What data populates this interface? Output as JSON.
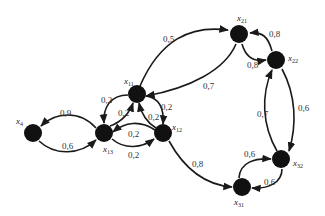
{
  "diagram": {
    "type": "directed-graph",
    "node_color": "#111111",
    "edge_color": "#1a1a1a",
    "background": "#ffffff",
    "nodes": [
      {
        "id": "x4",
        "label": "x",
        "sub": "4",
        "cx": 33,
        "cy": 133,
        "lx": 16,
        "ly": 124
      },
      {
        "id": "x13",
        "label": "x",
        "sub": "13",
        "cx": 104,
        "cy": 133,
        "lx": 103,
        "ly": 152
      },
      {
        "id": "x11",
        "label": "x",
        "sub": "11",
        "cx": 137,
        "cy": 94,
        "lx": 124,
        "ly": 84
      },
      {
        "id": "x12",
        "label": "x",
        "sub": "12",
        "cx": 163,
        "cy": 133,
        "lx": 172,
        "ly": 130
      },
      {
        "id": "x21",
        "label": "x",
        "sub": "21",
        "cx": 239,
        "cy": 34,
        "lx": 237,
        "ly": 21
      },
      {
        "id": "x22",
        "label": "x",
        "sub": "22",
        "cx": 276,
        "cy": 60,
        "lx": 288,
        "ly": 61
      },
      {
        "id": "x32",
        "label": "x",
        "sub": "32",
        "cx": 281,
        "cy": 159,
        "lx": 293,
        "ly": 166
      },
      {
        "id": "x31",
        "label": "x",
        "sub": "31",
        "cx": 242,
        "cy": 187,
        "lx": 234,
        "ly": 205
      }
    ],
    "edges": [
      {
        "from": "x11",
        "to": "x21",
        "weight": "0,5",
        "path": "M140,86 C160,40 190,25 228,30",
        "lx": 163,
        "ly": 42
      },
      {
        "from": "x21",
        "to": "x11",
        "weight": "0,7",
        "path": "M236,44 C225,70 190,88 146,96",
        "lx": 203,
        "ly": 89
      },
      {
        "from": "x22",
        "to": "x21",
        "weight": "0,8",
        "path": "M272,51 C268,36 262,32 250,33",
        "lx": 269,
        "ly": 37
      },
      {
        "from": "x21",
        "to": "x22",
        "weight": "0,8",
        "path": "M242,44 C246,58 255,62 266,60",
        "lx": 247,
        "ly": 68
      },
      {
        "from": "x22",
        "to": "x32",
        "weight": "0,6",
        "path": "M282,69 C296,95 297,125 289,151",
        "lx": 298,
        "ly": 111
      },
      {
        "from": "x32",
        "to": "x22",
        "weight": "0,7",
        "path": "M277,151 C262,125 261,95 272,70",
        "lx": 257,
        "ly": 117
      },
      {
        "from": "x31",
        "to": "x32",
        "weight": "0,6",
        "path": "M239,178 C240,162 255,158 271,159",
        "lx": 244,
        "ly": 157
      },
      {
        "from": "x32",
        "to": "x31",
        "weight": "0,6",
        "path": "M282,169 C282,183 268,189 252,188",
        "lx": 264,
        "ly": 185
      },
      {
        "from": "x12",
        "to": "x31",
        "weight": "0,8",
        "path": "M169,141 C185,170 205,185 232,187",
        "lx": 192,
        "ly": 167
      },
      {
        "from": "x11",
        "to": "x13",
        "weight": "0,2",
        "path": "M128,95 C110,95 103,108 104,123",
        "lx": 101,
        "ly": 103
      },
      {
        "from": "x13",
        "to": "x11",
        "weight": "0,2",
        "path": "M110,126 C122,122 130,112 133,103",
        "lx": 118,
        "ly": 116
      },
      {
        "from": "x11",
        "to": "x12",
        "weight": "0,2",
        "path": "M146,96 C160,98 164,110 163,124",
        "lx": 161,
        "ly": 110
      },
      {
        "from": "x12",
        "to": "x11",
        "weight": "0,2",
        "path": "M156,128 C146,122 141,112 139,103",
        "lx": 148,
        "ly": 120
      },
      {
        "from": "x12",
        "to": "x13",
        "weight": "0,2",
        "path": "M155,130 C140,120 125,122 113,132",
        "lx": 128,
        "ly": 137
      },
      {
        "from": "x13",
        "to": "x12",
        "weight": "0,2",
        "path": "M112,139 C125,150 142,148 154,139",
        "lx": 128,
        "ly": 158
      },
      {
        "from": "x13",
        "to": "x4",
        "weight": "0,9",
        "path": "M96,128 C80,110 55,112 41,126",
        "lx": 60,
        "ly": 116
      },
      {
        "from": "x4",
        "to": "x13",
        "weight": "0,6",
        "path": "M39,141 C55,156 80,155 96,140",
        "lx": 62,
        "ly": 149
      }
    ]
  }
}
